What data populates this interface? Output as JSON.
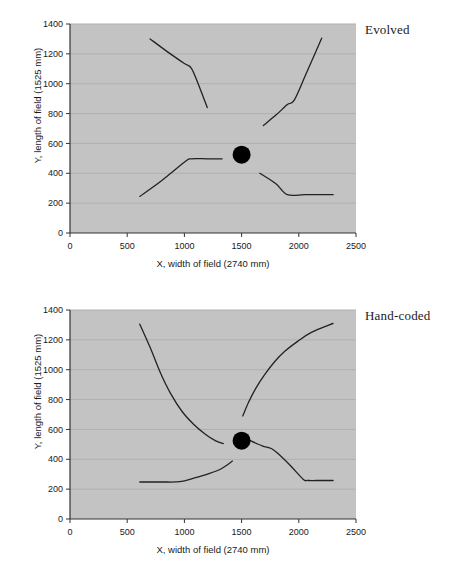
{
  "page": {
    "background_color": "#ffffff",
    "width": 463,
    "height": 571
  },
  "style": {
    "plot_background": "#c3c3c3",
    "gridline_color": "#b0b0b0",
    "axis_color": "#333333",
    "series_color": "#222222",
    "marker_color": "#000000"
  },
  "panels": [
    {
      "id": "evolved",
      "label": "Evolved",
      "xlabel": "X, width of field (2740 mm)",
      "ylabel": "Y, length of field (1525 mm)"
    },
    {
      "id": "handcoded",
      "label": "Hand-coded",
      "xlabel": "X, width of field (2740 mm)",
      "ylabel": "Y, length of field (1525 mm)"
    }
  ],
  "axes": {
    "xticks": [
      "0",
      "500",
      "1000",
      "1500",
      "2000",
      "2500"
    ],
    "xtick_values": [
      0,
      500,
      1000,
      1500,
      2000,
      2500
    ],
    "yticks": [
      "0",
      "200",
      "400",
      "600",
      "800",
      "1000",
      "1200",
      "1400"
    ],
    "ytick_values": [
      0,
      200,
      400,
      600,
      800,
      1000,
      1200,
      1400
    ],
    "xlim": [
      0,
      2500
    ],
    "ylim": [
      0,
      1400
    ],
    "grid": "horizontal"
  },
  "chart_data": [
    {
      "type": "line",
      "title": "Evolved",
      "xlabel": "X, width of field (2740 mm)",
      "ylabel": "Y, length of field (1525 mm)",
      "xlim": [
        0,
        2500
      ],
      "ylim": [
        0,
        1400
      ],
      "grid": true,
      "legend": "none",
      "annotations": [
        {
          "text": "Evolved",
          "position": "top-right-outside"
        }
      ],
      "markers": [
        {
          "name": "ball-marker",
          "x": 1500,
          "y": 525,
          "shape": "circle",
          "color": "#000000",
          "size_px": 18
        }
      ],
      "series": [
        {
          "name": "robot-path-upper-left",
          "points": [
            [
              700,
              1300
            ],
            [
              850,
              1215
            ],
            [
              1000,
              1135
            ],
            [
              1060,
              1105
            ],
            [
              1120,
              1000
            ],
            [
              1200,
              840
            ]
          ]
        },
        {
          "name": "robot-path-upper-right",
          "points": [
            [
              1690,
              720
            ],
            [
              1800,
              790
            ],
            [
              1900,
              860
            ],
            [
              1960,
              890
            ],
            [
              2060,
              1060
            ],
            [
              2200,
              1305
            ]
          ]
        },
        {
          "name": "robot-path-lower-left",
          "points": [
            [
              610,
              245
            ],
            [
              800,
              350
            ],
            [
              1010,
              480
            ],
            [
              1060,
              497
            ],
            [
              1200,
              497
            ],
            [
              1330,
              497
            ]
          ]
        },
        {
          "name": "robot-path-lower-right",
          "points": [
            [
              1660,
              400
            ],
            [
              1800,
              330
            ],
            [
              1900,
              257
            ],
            [
              2050,
              257
            ],
            [
              2200,
              257
            ],
            [
              2300,
              257
            ]
          ]
        }
      ]
    },
    {
      "type": "line",
      "title": "Hand-coded",
      "xlabel": "X, width of field (2740 mm)",
      "ylabel": "Y, length of field (1525 mm)",
      "xlim": [
        0,
        2500
      ],
      "ylim": [
        0,
        1400
      ],
      "grid": true,
      "legend": "none",
      "annotations": [
        {
          "text": "Hand-coded",
          "position": "top-right-outside"
        }
      ],
      "markers": [
        {
          "name": "ball-marker",
          "x": 1500,
          "y": 525,
          "shape": "circle",
          "color": "#000000",
          "size_px": 18
        }
      ],
      "series": [
        {
          "name": "robot-path-upper-left",
          "points": [
            [
              610,
              1305
            ],
            [
              700,
              1150
            ],
            [
              790,
              980
            ],
            [
              880,
              840
            ],
            [
              980,
              720
            ],
            [
              1080,
              635
            ],
            [
              1180,
              570
            ],
            [
              1270,
              525
            ],
            [
              1340,
              505
            ]
          ]
        },
        {
          "name": "robot-path-upper-right",
          "points": [
            [
              1510,
              690
            ],
            [
              1560,
              780
            ],
            [
              1620,
              870
            ],
            [
              1700,
              965
            ],
            [
              1790,
              1055
            ],
            [
              1880,
              1125
            ],
            [
              1990,
              1190
            ],
            [
              2110,
              1250
            ],
            [
              2300,
              1310
            ]
          ]
        },
        {
          "name": "robot-path-lower-left",
          "points": [
            [
              610,
              248
            ],
            [
              800,
              248
            ],
            [
              960,
              250
            ],
            [
              1090,
              275
            ],
            [
              1220,
              305
            ],
            [
              1330,
              340
            ],
            [
              1420,
              388
            ]
          ]
        },
        {
          "name": "robot-path-lower-right",
          "points": [
            [
              1560,
              530
            ],
            [
              1680,
              490
            ],
            [
              1760,
              472
            ],
            [
              1830,
              430
            ],
            [
              1930,
              355
            ],
            [
              2040,
              265
            ],
            [
              2080,
              258
            ],
            [
              2200,
              258
            ],
            [
              2300,
              258
            ]
          ]
        }
      ]
    }
  ]
}
